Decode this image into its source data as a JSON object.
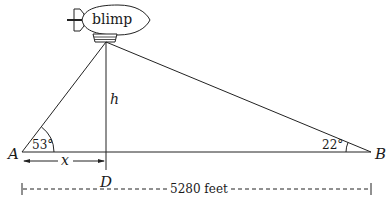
{
  "diagram": {
    "blimp_label": "blimp",
    "points": {
      "A": "A",
      "B": "B",
      "D": "D"
    },
    "angles": {
      "at_A": "53°",
      "at_B": "22°"
    },
    "segments": {
      "height": "h",
      "AD": "x",
      "AB_distance": "5280 feet"
    }
  }
}
